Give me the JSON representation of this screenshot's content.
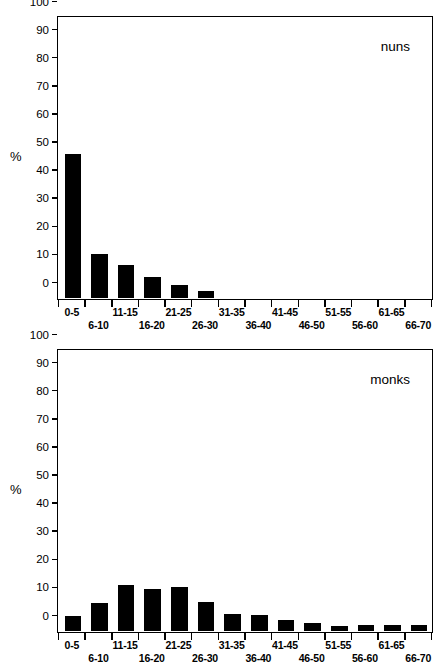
{
  "figure": {
    "axis_y_label": "%",
    "y_ticks": [
      100,
      90,
      80,
      70,
      60,
      50,
      40,
      30,
      20,
      10,
      0
    ],
    "categories": [
      "0-5",
      "6-10",
      "11-15",
      "16-20",
      "21-25",
      "26-30",
      "31-35",
      "36-40",
      "41-45",
      "46-50",
      "51-55",
      "56-60",
      "61-65",
      "66-70"
    ],
    "bar_color": "#000000",
    "axis_color": "#000000"
  },
  "chart_data": [
    {
      "type": "bar",
      "title": "nuns",
      "categories": [
        "0-5",
        "6-10",
        "11-15",
        "16-20",
        "21-25",
        "26-30",
        "31-35",
        "36-40",
        "41-45",
        "46-50",
        "51-55",
        "56-60",
        "61-65",
        "66-70"
      ],
      "values": [
        51,
        15.5,
        11.5,
        7.3,
        4.5,
        2.3,
        0,
        0,
        0,
        0,
        0,
        0,
        0,
        0
      ],
      "xlabel": "",
      "ylabel": "%",
      "ylim": [
        0,
        100
      ],
      "ytick_step": 10,
      "grid": false,
      "legend": "none"
    },
    {
      "type": "bar",
      "title": "monks",
      "categories": [
        "0-5",
        "6-10",
        "11-15",
        "16-20",
        "21-25",
        "26-30",
        "31-35",
        "36-40",
        "41-45",
        "46-50",
        "51-55",
        "56-60",
        "61-65",
        "66-70"
      ],
      "values": [
        5,
        9.8,
        16.3,
        14.6,
        15.5,
        10,
        6,
        5.5,
        3.9,
        2.5,
        1.6,
        1.8,
        1.9,
        2.1
      ],
      "xlabel": "",
      "ylabel": "%",
      "ylim": [
        0,
        100
      ],
      "ytick_step": 10,
      "grid": false,
      "legend": "none"
    }
  ]
}
